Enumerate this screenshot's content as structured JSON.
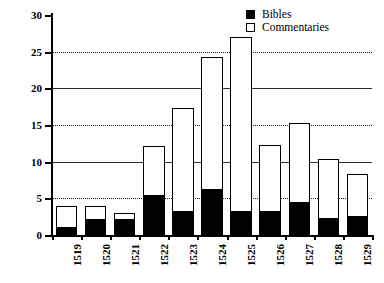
{
  "chart_data": {
    "type": "bar",
    "stacked": true,
    "title": "",
    "subtitle": "",
    "xlabel": "",
    "ylabel": "",
    "categories": [
      "1519",
      "1520",
      "1521",
      "1522",
      "1523",
      "1524",
      "1525",
      "1526",
      "1527",
      "1528",
      "1529"
    ],
    "series": [
      {
        "name": "Bibles",
        "color": "#000000",
        "values": [
          1,
          2,
          2,
          5.3,
          3.2,
          6.2,
          3.2,
          3.2,
          4.4,
          2.2,
          2.5
        ]
      },
      {
        "name": "Commentaries",
        "color": "#ffffff",
        "values": [
          3,
          2,
          1,
          6.9,
          14.1,
          18.1,
          23.8,
          9.1,
          10.9,
          8.1,
          5.8
        ]
      }
    ],
    "totals": [
      4,
      4,
      3,
      12.2,
      17.3,
      24.3,
      27,
      12.3,
      15.3,
      10.3,
      8.3
    ],
    "ylim": [
      0,
      30
    ],
    "yticks": [
      0,
      5,
      10,
      15,
      20,
      25,
      30
    ],
    "ytick_labels": [
      "0",
      "5",
      "10",
      "15",
      "20",
      "25",
      "30"
    ],
    "grid": true,
    "grid_axis": "y",
    "legend_position": "top-right"
  },
  "legend": {
    "entries": [
      {
        "label": "Bibles",
        "swatch": "filled-square-icon"
      },
      {
        "label": "Commentaries",
        "swatch": "hollow-square-icon"
      }
    ]
  }
}
